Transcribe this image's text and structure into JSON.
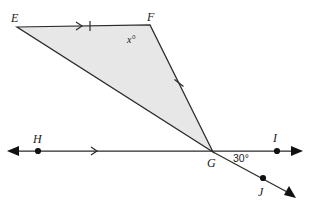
{
  "figure": {
    "type": "geometry-diagram",
    "background_color": "#ffffff",
    "stroke_color": "#2b2b2b",
    "fill_color": "#e7e7e7",
    "dot_color": "#111111"
  },
  "labels": {
    "E": "E",
    "F": "F",
    "G": "G",
    "H": "H",
    "I": "I",
    "J": "J",
    "angle_x": "x°",
    "angle_30": "30°"
  },
  "points": {
    "E": {
      "x": 17,
      "y": 27,
      "label": "E",
      "label_x": 13,
      "label_y": 21
    },
    "F": {
      "x": 150,
      "y": 25,
      "label": "F",
      "label_x": 151,
      "label_y": 21
    },
    "G": {
      "x": 213,
      "y": 152,
      "label": "G",
      "label_x": 208,
      "label_y": 166
    },
    "H": {
      "x": 38,
      "y": 151,
      "label": "H",
      "label_x": 33,
      "label_y": 141
    },
    "I": {
      "x": 277,
      "y": 151,
      "label": "I",
      "label_x": 274,
      "label_y": 140
    },
    "J": {
      "x": 263,
      "y": 178,
      "label": "J",
      "label_x": 259,
      "label_y": 194
    }
  },
  "shaded_polygon": {
    "name": "triangle-EFG",
    "vertices": "17,27 150,25 213,152"
  },
  "segments": [
    {
      "name": "segment-EF",
      "from": "E",
      "to": "F",
      "marks": "single-tick-and-arrow"
    },
    {
      "name": "segment-EG",
      "from": "E",
      "to": "G",
      "marks": "none"
    },
    {
      "name": "segment-FG",
      "from": "F",
      "to": "G",
      "marks": "single-tick"
    }
  ],
  "lines": {
    "HI": {
      "name": "line-HI",
      "x1": 13,
      "y1": 151,
      "x2": 297,
      "y2": 151,
      "marks": "single-arrow-chevron",
      "double_ended": true
    },
    "GJ": {
      "name": "ray-GJ",
      "x1": 213,
      "y1": 152,
      "x2": 291,
      "y2": 194,
      "double_ended": false
    }
  },
  "markers": {
    "chevron_EF": {
      "x": 80,
      "y": 26,
      "rotation": 0
    },
    "tick_EF": {
      "x": 90,
      "y": 26,
      "rotation": 0
    },
    "tick_FG": {
      "x": 179,
      "y": 83,
      "rotation": 64
    },
    "chevron_HI": {
      "x": 96,
      "y": 151,
      "rotation": 0
    }
  },
  "angles": {
    "x": {
      "label": "x°",
      "at_vertex": "F",
      "label_x": 127,
      "label_y": 41
    },
    "thirty": {
      "label": "30°",
      "at_vertex": "G",
      "label_x": 234,
      "label_y": 161,
      "value": 30
    }
  },
  "arrowheads": [
    {
      "name": "arrowhead-left-HI",
      "x": 13,
      "y": 151,
      "angle": 180
    },
    {
      "name": "arrowhead-right-HI",
      "x": 297,
      "y": 151,
      "angle": 0
    },
    {
      "name": "arrowhead-GJ",
      "x": 291,
      "y": 194,
      "angle": 28
    }
  ]
}
